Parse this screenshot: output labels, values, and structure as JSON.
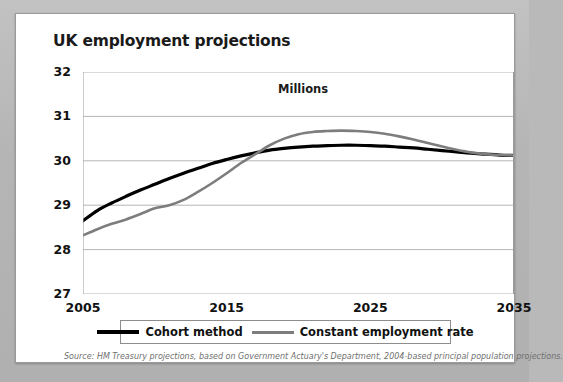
{
  "chart_data": {
    "type": "line",
    "title": "UK employment projections",
    "units_label": "Millions",
    "xlabel": "",
    "ylabel": "",
    "xlim": [
      2005,
      2035
    ],
    "ylim": [
      27,
      32
    ],
    "grid": true,
    "legend_position": "bottom",
    "y_ticks": [
      32,
      31,
      30,
      29,
      28,
      27
    ],
    "x_ticks": [
      2005,
      2015,
      2025,
      2035
    ],
    "x_minor_tick_interval": 1,
    "x": [
      2005,
      2006,
      2007,
      2008,
      2009,
      2010,
      2011,
      2012,
      2013,
      2014,
      2015,
      2016,
      2017,
      2018,
      2019,
      2020,
      2021,
      2022,
      2023,
      2024,
      2025,
      2026,
      2027,
      2028,
      2029,
      2030,
      2031,
      2032,
      2033,
      2034,
      2035
    ],
    "series": [
      {
        "name": "Cohort method",
        "color": "#000000",
        "values": [
          28.65,
          28.88,
          29.05,
          29.2,
          29.34,
          29.47,
          29.6,
          29.72,
          29.83,
          29.94,
          30.03,
          30.11,
          30.18,
          30.24,
          30.28,
          30.31,
          30.33,
          30.34,
          30.35,
          30.35,
          30.34,
          30.33,
          30.31,
          30.29,
          30.26,
          30.23,
          30.2,
          30.17,
          30.15,
          30.13,
          30.12
        ]
      },
      {
        "name": "Constant employment rate",
        "color": "#7d7d7d",
        "values": [
          28.32,
          28.46,
          28.58,
          28.68,
          28.8,
          28.93,
          29.0,
          29.12,
          29.3,
          29.5,
          29.72,
          29.95,
          30.15,
          30.35,
          30.5,
          30.6,
          30.65,
          30.67,
          30.68,
          30.67,
          30.65,
          30.61,
          30.55,
          30.48,
          30.4,
          30.32,
          30.25,
          30.19,
          30.15,
          30.13,
          30.12
        ]
      }
    ],
    "source_note": "Source: HM Treasury projections, based on Government Actuary's Department, 2004-based principal population projections."
  }
}
